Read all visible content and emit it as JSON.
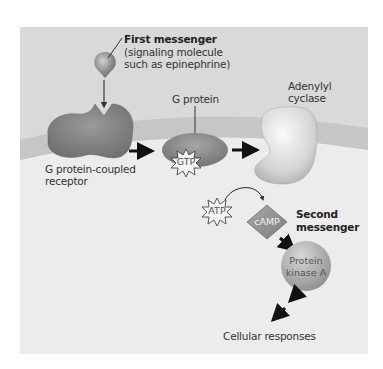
{
  "figure": {
    "colors": {
      "panel_bg": "#d9d9d9",
      "membrane": "#c8c8c8",
      "cytoplasm": "#ececec",
      "molecule": "#8a8a8a",
      "arrow": "#111111"
    },
    "labels": {
      "first_messenger_title": "First messenger",
      "first_messenger_desc_line1": "(signaling molecule",
      "first_messenger_desc_line2": "such as epinephrine)",
      "g_protein": "G protein",
      "adenylyl_cyclase_line1": "Adenylyl",
      "adenylyl_cyclase_line2": "cyclase",
      "receptor_line1": "G protein-coupled",
      "receptor_line2": "receptor",
      "gtp": "GTP",
      "atp": "ATP",
      "camp": "cAMP",
      "second_messenger_line1": "Second",
      "second_messenger_line2": "messenger",
      "pka_line1": "Protein",
      "pka_line2": "kinase A",
      "cellular_responses": "Cellular responses"
    }
  }
}
